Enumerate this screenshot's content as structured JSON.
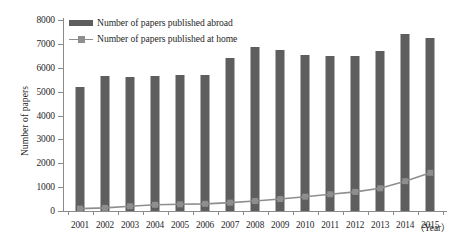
{
  "chart_data": {
    "type": "bar",
    "title": "",
    "xlabel": "(Year)",
    "ylabel": "Number of papers",
    "categories": [
      "2001",
      "2002",
      "2003",
      "2004",
      "2005",
      "2006",
      "2007",
      "2008",
      "2009",
      "2010",
      "2011",
      "2012",
      "2013",
      "2014",
      "2015"
    ],
    "ylim": [
      0,
      8000
    ],
    "ytick_values": [
      0,
      1000,
      2000,
      3000,
      4000,
      5000,
      6000,
      7000,
      8000
    ],
    "ytick_labels": [
      "0",
      "1000",
      "2000",
      "3000",
      "4000",
      "5000",
      "6000",
      "7000",
      "8000"
    ],
    "grid": false,
    "legend_position": "top-left",
    "series": [
      {
        "name": "Number of papers published abroad",
        "type": "bar",
        "color": "#5e5e5e",
        "values": [
          5200,
          5650,
          5600,
          5650,
          5700,
          5700,
          6400,
          6850,
          6750,
          6550,
          6500,
          6500,
          6700,
          7400,
          7250
        ]
      },
      {
        "name": "Number of papers published at home",
        "type": "line",
        "color": "#8e8e8e",
        "values": [
          100,
          130,
          200,
          260,
          280,
          300,
          350,
          420,
          500,
          600,
          700,
          800,
          950,
          1250,
          1600
        ]
      }
    ]
  },
  "axes": {
    "y_title": "Number of papers",
    "x_unit": "（Year）"
  },
  "legend": {
    "items": [
      {
        "label": "Number of papers published abroad",
        "marker": "bar-swatch"
      },
      {
        "label": "Number of papers published at home",
        "marker": "line-square-swatch"
      }
    ]
  },
  "colors": {
    "bar": "#5e5e5e",
    "line": "#8e8e8e",
    "axis": "#8b8b8b",
    "text": "#1f1f1f",
    "background": "#ffffff"
  }
}
